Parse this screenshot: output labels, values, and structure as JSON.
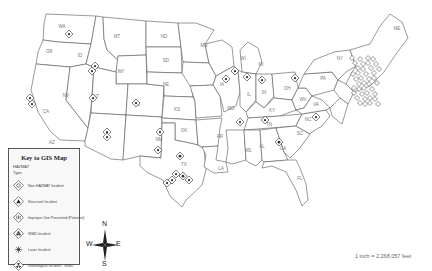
{
  "map": {
    "title": "Key to GIS Map",
    "scale_text": "1 inch = 2,268,057 feet",
    "colors": {
      "state_fill": "#ffffff",
      "state_stroke": "#555555",
      "label": "#777777",
      "marker": "#333333"
    }
  },
  "legend": {
    "title": "Key to GIS Map",
    "layer": "HAZMAT",
    "field": "Type",
    "items": [
      {
        "icon": "hazmat-diamond-icon",
        "label": "Non-HAZMAT Incident"
      },
      {
        "icon": "explosion-diamond-icon",
        "label": "Structural Incident"
      },
      {
        "icon": "hand-diamond-icon",
        "label": "Improper Use Prevented (Potential)"
      },
      {
        "icon": "biohazard-diamond-icon",
        "label": "WMD Incident"
      },
      {
        "icon": "radiation-diamond-icon",
        "label": "Laser Incident"
      },
      {
        "icon": "nuclear-diamond-icon",
        "label": "Radiological Incident - WMD"
      }
    ]
  },
  "compass": {
    "n": "N",
    "s": "S",
    "e": "E",
    "w": "W"
  },
  "states": [
    {
      "code": "WA",
      "x": 62,
      "y": 28
    },
    {
      "code": "OR",
      "x": 49,
      "y": 53
    },
    {
      "code": "CA",
      "x": 46,
      "y": 113
    },
    {
      "code": "ID",
      "x": 80,
      "y": 57
    },
    {
      "code": "NV",
      "x": 66,
      "y": 97
    },
    {
      "code": "MT",
      "x": 117,
      "y": 38
    },
    {
      "code": "WY",
      "x": 121,
      "y": 73
    },
    {
      "code": "UT",
      "x": 96,
      "y": 98
    },
    {
      "code": "AZ",
      "x": 52,
      "y": 144
    },
    {
      "code": "CO",
      "x": 137,
      "y": 106
    },
    {
      "code": "NM",
      "x": 159,
      "y": 141
    },
    {
      "code": "ND",
      "x": 164,
      "y": 38
    },
    {
      "code": "SD",
      "x": 166,
      "y": 62
    },
    {
      "code": "NE",
      "x": 166,
      "y": 86
    },
    {
      "code": "KS",
      "x": 177,
      "y": 111
    },
    {
      "code": "OK",
      "x": 184,
      "y": 132
    },
    {
      "code": "TX",
      "x": 184,
      "y": 166
    },
    {
      "code": "MN",
      "x": 204,
      "y": 47
    },
    {
      "code": "IA",
      "x": 222,
      "y": 86
    },
    {
      "code": "MO",
      "x": 231,
      "y": 110
    },
    {
      "code": "AR",
      "x": 220,
      "y": 138
    },
    {
      "code": "LA",
      "x": 221,
      "y": 170
    },
    {
      "code": "WI",
      "x": 243,
      "y": 60
    },
    {
      "code": "IL",
      "x": 249,
      "y": 96
    },
    {
      "code": "MI",
      "x": 261,
      "y": 66
    },
    {
      "code": "IN",
      "x": 264,
      "y": 94
    },
    {
      "code": "OH",
      "x": 287,
      "y": 90
    },
    {
      "code": "KY",
      "x": 272,
      "y": 112
    },
    {
      "code": "TN",
      "x": 269,
      "y": 126
    },
    {
      "code": "MS",
      "x": 248,
      "y": 152
    },
    {
      "code": "AL",
      "x": 262,
      "y": 148
    },
    {
      "code": "GA",
      "x": 283,
      "y": 150
    },
    {
      "code": "FL",
      "x": 300,
      "y": 180
    },
    {
      "code": "SC",
      "x": 300,
      "y": 135
    },
    {
      "code": "NC",
      "x": 308,
      "y": 121
    },
    {
      "code": "VA",
      "x": 316,
      "y": 106
    },
    {
      "code": "WV",
      "x": 303,
      "y": 101
    },
    {
      "code": "PA",
      "x": 323,
      "y": 80
    },
    {
      "code": "NY",
      "x": 340,
      "y": 60
    },
    {
      "code": "ME",
      "x": 397,
      "y": 30
    }
  ],
  "markers": [
    {
      "x": 69,
      "y": 34,
      "type": "hazmat"
    },
    {
      "x": 95,
      "y": 66,
      "type": "biohazard"
    },
    {
      "x": 92,
      "y": 71,
      "type": "hazmat"
    },
    {
      "x": 30,
      "y": 98,
      "type": "hazmat"
    },
    {
      "x": 32,
      "y": 104,
      "type": "biohazard"
    },
    {
      "x": 93,
      "y": 98,
      "type": "hazmat"
    },
    {
      "x": 136,
      "y": 103,
      "type": "biohazard"
    },
    {
      "x": 107,
      "y": 132,
      "type": "hazmat"
    },
    {
      "x": 107,
      "y": 137,
      "type": "biohazard"
    },
    {
      "x": 160,
      "y": 132,
      "type": "nuclear"
    },
    {
      "x": 180,
      "y": 156,
      "type": "explosion"
    },
    {
      "x": 158,
      "y": 150,
      "type": "hazmat"
    },
    {
      "x": 167,
      "y": 183,
      "type": "hazmat"
    },
    {
      "x": 172,
      "y": 180,
      "type": "biohazard"
    },
    {
      "x": 176,
      "y": 174,
      "type": "hazmat"
    },
    {
      "x": 183,
      "y": 176,
      "type": "explosion"
    },
    {
      "x": 189,
      "y": 180,
      "type": "hazmat"
    },
    {
      "x": 240,
      "y": 122,
      "type": "biohazard"
    },
    {
      "x": 265,
      "y": 120,
      "type": "nuclear"
    },
    {
      "x": 279,
      "y": 142,
      "type": "explosion"
    },
    {
      "x": 235,
      "y": 71,
      "type": "hazmat"
    },
    {
      "x": 226,
      "y": 79,
      "type": "hazmat"
    },
    {
      "x": 247,
      "y": 77,
      "type": "biohazard"
    },
    {
      "x": 262,
      "y": 80,
      "type": "hazmat"
    },
    {
      "x": 295,
      "y": 78,
      "type": "hazmat"
    },
    {
      "x": 316,
      "y": 117,
      "type": "hazmat"
    }
  ]
}
